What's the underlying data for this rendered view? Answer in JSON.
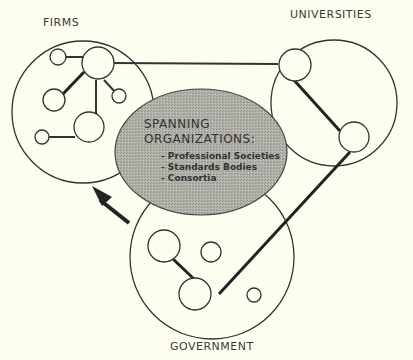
{
  "diagram": {
    "type": "venn-network",
    "background": "#fdfdf0",
    "groups": [
      {
        "id": "firms",
        "label": "FIRMS"
      },
      {
        "id": "universities",
        "label": "UNIVERSITIES"
      },
      {
        "id": "government",
        "label": "GOVERNMENT"
      }
    ],
    "center": {
      "title_line1": "SPANNING",
      "title_line2": "ORGANIZATIONS:",
      "items": [
        "- Professional Societies",
        "- Standards Bodies",
        "- Consortia"
      ],
      "fill": "#a8a8a0"
    },
    "arrow": {
      "direction": "up-left",
      "meaning": "flow toward firms"
    }
  }
}
